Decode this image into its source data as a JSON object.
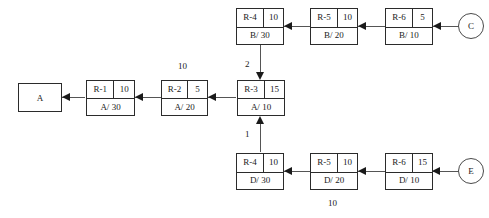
{
  "diagram": {
    "colors": {
      "stroke": "#2b2b2b",
      "line": "#555555",
      "arrow": "#1a1a1a",
      "background": "#ffffff",
      "text": "#1a1a1a"
    },
    "terminals": {
      "a": {
        "label": "A",
        "shape": "rect"
      },
      "c": {
        "label": "C",
        "shape": "circle"
      },
      "e": {
        "label": "E",
        "shape": "circle"
      }
    },
    "chains": {
      "chain_a": {
        "route": "A",
        "nodes": [
          {
            "id": "R-1",
            "qty": "10",
            "detail": "A/ 30"
          },
          {
            "id": "R-2",
            "qty": "5",
            "detail": "A/ 20"
          },
          {
            "id": "R-3",
            "qty": "15",
            "detail": "A/ 10"
          }
        ]
      },
      "chain_b": {
        "route": "B",
        "nodes": [
          {
            "id": "R-4",
            "qty": "10",
            "detail": "B/ 30"
          },
          {
            "id": "R-5",
            "qty": "10",
            "detail": "B/ 20"
          },
          {
            "id": "R-6",
            "qty": "5",
            "detail": "B/ 10"
          }
        ]
      },
      "chain_d": {
        "route": "D",
        "nodes": [
          {
            "id": "R-4",
            "qty": "10",
            "detail": "D/ 30"
          },
          {
            "id": "R-5",
            "qty": "10",
            "detail": "D/ 20"
          },
          {
            "id": "R-6",
            "qty": "15",
            "detail": "D/ 10"
          }
        ]
      }
    },
    "edge_labels": {
      "top_middle": "10",
      "branch_from_b": "2",
      "branch_from_d": "1",
      "bottom_center": "10"
    }
  }
}
